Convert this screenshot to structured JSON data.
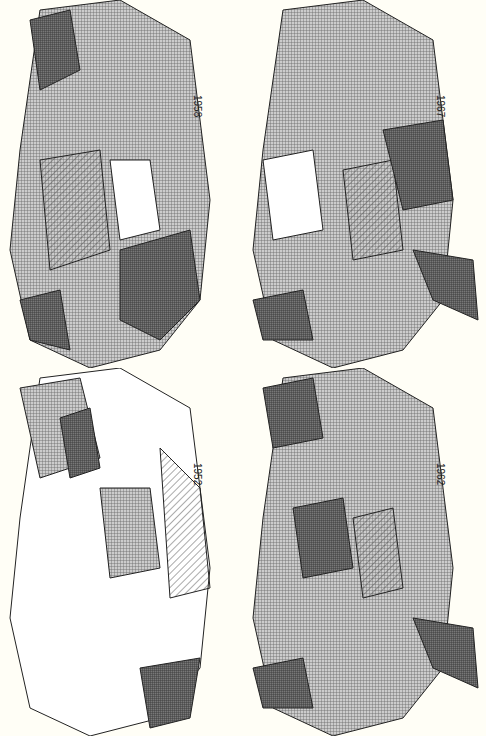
{
  "maps": [
    {
      "year": "1958",
      "position": "top-left"
    },
    {
      "year": "1967",
      "position": "top-right"
    },
    {
      "year": "1952",
      "position": "bottom-left"
    },
    {
      "year": "1962",
      "position": "bottom-right"
    }
  ],
  "legend_patterns": [
    "white",
    "diagonal-hatch",
    "light-crosshatch",
    "dense-crosshatch",
    "dark"
  ],
  "colors": {
    "background": "#fffef6",
    "ink": "#222222"
  }
}
